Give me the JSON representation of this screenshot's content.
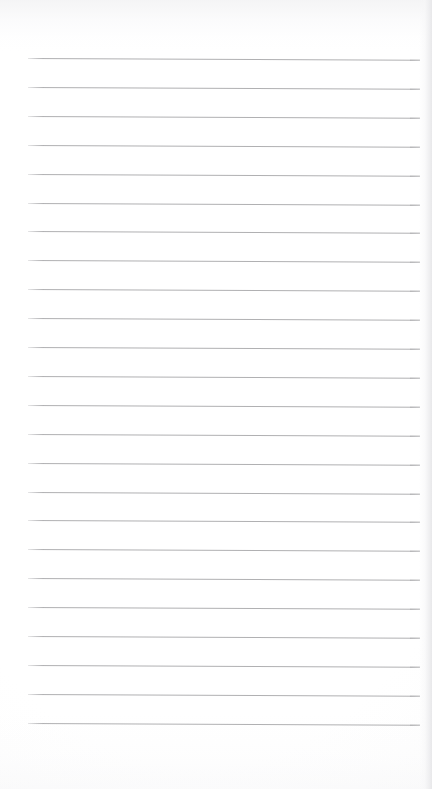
{
  "document": {
    "kind": "lined-paper-scan",
    "title": "Blank ruled notebook page",
    "content_text": "",
    "written_lines": [],
    "page_number_text": ""
  },
  "page": {
    "width_px": 432,
    "height_px": 789,
    "background_color": "#ffffff",
    "paper_tone_color": "#fdfdfd"
  },
  "ruling": {
    "line_color": "#b0b0b2",
    "line_thickness_px": 1,
    "line_count": 24,
    "first_line_y_px": 58,
    "line_spacing_px": 28.9,
    "line_left_x_px": 28,
    "line_right_x_px": 420,
    "line_length_px": 392,
    "skew_degrees": 0.26,
    "margin_rule_present": false,
    "left_margin_px": 28,
    "right_margin_px": 12,
    "top_margin_px": 58,
    "bottom_margin_px": 67
  },
  "artifacts": {
    "top_smudge_color": "#ececee",
    "bottom_smudge_color": "#f4f4f6",
    "right_edge_shadow_color": "#e7e7e9"
  }
}
